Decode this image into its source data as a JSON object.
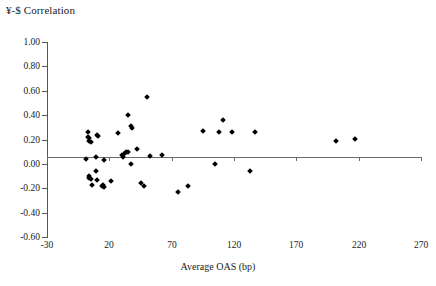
{
  "chart_data": {
    "type": "scatter",
    "title": "¥-$ Correlation",
    "xlabel": "Average OAS (bp)",
    "ylabel": "",
    "xlim": [
      -30,
      270
    ],
    "ylim": [
      -0.6,
      1.0
    ],
    "xticks": [
      -30,
      20,
      70,
      120,
      170,
      220,
      270
    ],
    "xtick_labels": [
      "-30",
      "20",
      "70",
      "120",
      "170",
      "220",
      "270"
    ],
    "yticks": [
      -0.6,
      -0.4,
      -0.2,
      0.0,
      0.2,
      0.4,
      0.6,
      0.8,
      1.0
    ],
    "ytick_labels": [
      "-0.60",
      "-0.40",
      "-0.20",
      "0.00",
      "0.20",
      "0.40",
      "0.60",
      "0.80",
      "1.00"
    ],
    "grid": false,
    "legend": false,
    "marker": "diamond",
    "marker_color": "#000000",
    "zero_line": true,
    "points": [
      {
        "x": 3,
        "y": 0.26
      },
      {
        "x": 3,
        "y": 0.22
      },
      {
        "x": 4,
        "y": 0.21
      },
      {
        "x": 4,
        "y": 0.185
      },
      {
        "x": 5,
        "y": 0.18
      },
      {
        "x": 10,
        "y": 0.235
      },
      {
        "x": 11,
        "y": 0.23
      },
      {
        "x": 1,
        "y": 0.04
      },
      {
        "x": 9,
        "y": 0.055
      },
      {
        "x": 16,
        "y": 0.035
      },
      {
        "x": 4,
        "y": -0.1
      },
      {
        "x": 4,
        "y": -0.115
      },
      {
        "x": 5,
        "y": -0.125
      },
      {
        "x": 9,
        "y": -0.06
      },
      {
        "x": 10,
        "y": -0.135
      },
      {
        "x": 6,
        "y": -0.175
      },
      {
        "x": 14,
        "y": -0.18
      },
      {
        "x": 15,
        "y": -0.185
      },
      {
        "x": 15,
        "y": -0.175
      },
      {
        "x": 16,
        "y": -0.19
      },
      {
        "x": 21,
        "y": -0.14
      },
      {
        "x": 27,
        "y": 0.25
      },
      {
        "x": 35,
        "y": 0.405
      },
      {
        "x": 37,
        "y": 0.31
      },
      {
        "x": 38,
        "y": 0.295
      },
      {
        "x": 30,
        "y": 0.07
      },
      {
        "x": 31,
        "y": 0.055
      },
      {
        "x": 32,
        "y": 0.085
      },
      {
        "x": 33,
        "y": 0.095
      },
      {
        "x": 35,
        "y": 0.1
      },
      {
        "x": 42,
        "y": 0.12
      },
      {
        "x": 37,
        "y": 0.0
      },
      {
        "x": 53,
        "y": 0.065
      },
      {
        "x": 62,
        "y": 0.075
      },
      {
        "x": 50,
        "y": 0.545
      },
      {
        "x": 45,
        "y": -0.155
      },
      {
        "x": 48,
        "y": -0.185
      },
      {
        "x": 75,
        "y": -0.23
      },
      {
        "x": 83,
        "y": -0.185
      },
      {
        "x": 95,
        "y": 0.27
      },
      {
        "x": 108,
        "y": 0.265
      },
      {
        "x": 111,
        "y": 0.36
      },
      {
        "x": 118,
        "y": 0.26
      },
      {
        "x": 105,
        "y": 0.0
      },
      {
        "x": 137,
        "y": 0.265
      },
      {
        "x": 133,
        "y": -0.055
      },
      {
        "x": 202,
        "y": 0.19
      },
      {
        "x": 217,
        "y": 0.205
      }
    ]
  },
  "axis": {
    "x_title": "Average OAS (bp)"
  }
}
